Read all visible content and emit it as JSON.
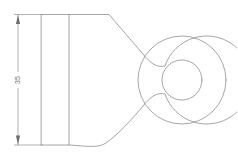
{
  "drawing": {
    "title": "Lug Eye Bracket Outline",
    "view_label": "front-view",
    "background_color": "#ffffff",
    "line_color": "#8f8f8f",
    "text_color": "#6e6e6e",
    "dimensions": [
      {
        "id": "flange-height",
        "value": "35",
        "orientation": "vertical",
        "text_rotation_deg": -90,
        "dim_line_x": 18,
        "from_y": 14,
        "to_y": 145,
        "text_x": 18,
        "text_y": 80,
        "extension_from_x": 14,
        "extension_to_x": 43,
        "arrow_style": "filled-closed"
      }
    ],
    "geometry": {
      "flange_rect": {
        "name": "mounting-flange",
        "x": 41,
        "y": 14,
        "width": 28,
        "height": 131
      },
      "body_path": "M 69,14 L 69,145 L 105,145 C 128,145 140,128 152,117 C 161,109 168,109 176,110 L 176,49 C 168,50 161,50 152,43 C 140,33 128,15 105,14 Z",
      "body_outline_path": "M 69,14 L 108.5,14 C 120,25 133,44 143,52 C 152,59 160,60 168,58 L 168,101 C 160,99 152,100 143,107 C 133,115 120,134 108.5,145 L 69,145",
      "boss_circle": {
        "name": "eye-boss-outer",
        "cx": 182,
        "cy": 80,
        "r": 44
      },
      "bore_circle": {
        "name": "eye-bore-inner",
        "cx": 182,
        "cy": 80,
        "r": 20
      }
    }
  }
}
